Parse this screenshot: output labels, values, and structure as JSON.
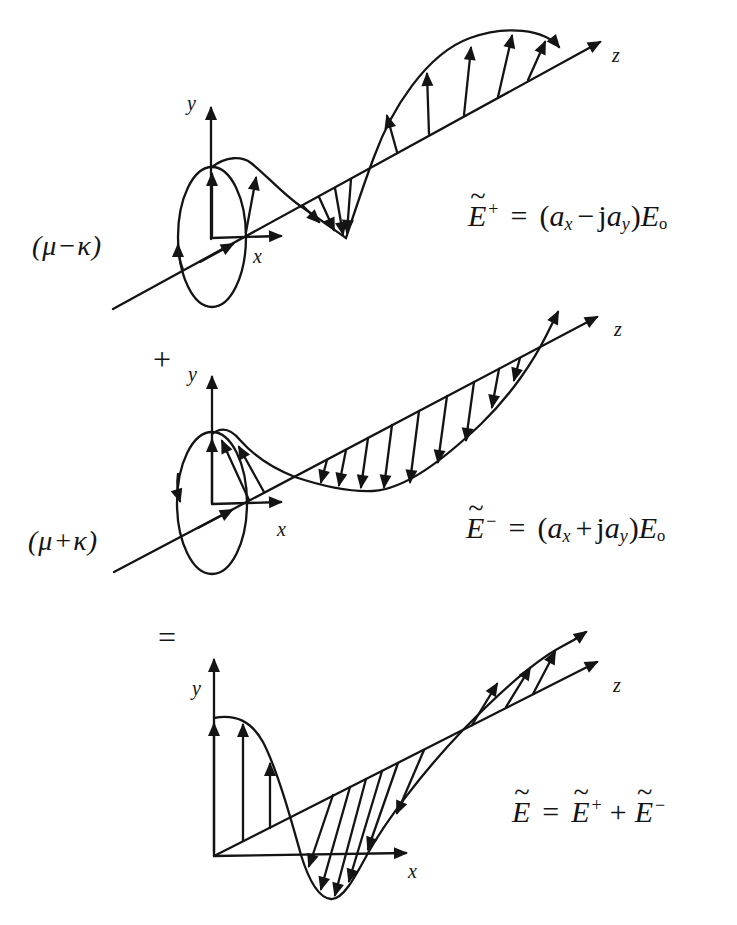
{
  "colors": {
    "ink": "#141414",
    "background": "#ffffff"
  },
  "rows": [
    {
      "name": "right-circular-component",
      "coef_label": "(μ−κ)",
      "axes": {
        "x": "x",
        "y": "y",
        "z": "z"
      },
      "equation": {
        "E": "E",
        "tilde": "~",
        "sup": "+",
        "rel": "=",
        "open": "(",
        "a1": "a",
        "sub1": "x",
        "op": "−",
        "j": "j",
        "a2": "a",
        "sub2": "y",
        "close": ")",
        "E2": "E",
        "subo": "o"
      }
    },
    {
      "name": "left-circular-component",
      "operator_before": "+",
      "coef_label": "(μ+κ)",
      "axes": {
        "x": "x",
        "y": "y",
        "z": "z"
      },
      "equation": {
        "E": "E",
        "tilde": "~",
        "sup": "−",
        "rel": "=",
        "open": "(",
        "a1": "a",
        "sub1": "x",
        "op": "+",
        "j": "j",
        "a2": "a",
        "sub2": "y",
        "close": ")",
        "E2": "E",
        "subo": "o"
      }
    },
    {
      "name": "linear-sum",
      "operator_before": "=",
      "axes": {
        "x": "x",
        "y": "y",
        "z": "z"
      },
      "equation": {
        "E": "E",
        "tilde": "~",
        "rel": "=",
        "E1": "E",
        "t1": "~",
        "sup1": "+",
        "op": "+",
        "E2": "E",
        "t2": "~",
        "sup2": "−"
      }
    }
  ]
}
